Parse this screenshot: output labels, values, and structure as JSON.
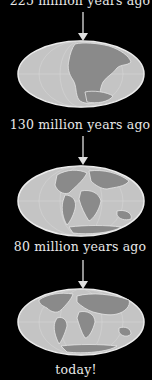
{
  "stages": [
    {
      "label": "225 million years ago",
      "era": "Pangaea"
    },
    {
      "label": "130 million years ago",
      "era": "breakup"
    },
    {
      "label": "80 million years ago",
      "era": "drifting"
    },
    {
      "label": "today!",
      "era": "present"
    }
  ],
  "colors": {
    "background": "#000000",
    "ocean": "#c4c4c4",
    "land": "#8a8a8a",
    "outline": "#e6e6e6",
    "text": "#e8e8e8"
  }
}
